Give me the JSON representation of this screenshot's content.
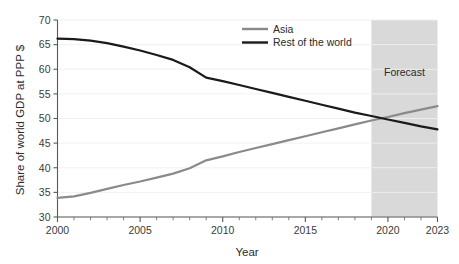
{
  "chart_data": {
    "type": "line",
    "title": "",
    "subtitle": "",
    "xlabel": "Year",
    "ylabel": "Share of world GDP at PPP $",
    "xlim": [
      2000,
      2023
    ],
    "ylim": [
      30,
      70
    ],
    "grid": true,
    "legend_position": "top-center",
    "background_color": "#ffffff",
    "x": [
      2000,
      2001,
      2002,
      2003,
      2004,
      2005,
      2006,
      2007,
      2008,
      2009,
      2010,
      2011,
      2012,
      2013,
      2014,
      2015,
      2016,
      2017,
      2018,
      2019,
      2020,
      2021,
      2022,
      2023
    ],
    "xticks": [
      2000,
      2001,
      2002,
      2003,
      2004,
      2005,
      2006,
      2007,
      2008,
      2009,
      2010,
      2011,
      2012,
      2013,
      2014,
      2015,
      2016,
      2017,
      2018,
      2019,
      2020,
      2021,
      2022,
      2023
    ],
    "xtick_labels": [
      "2000",
      "",
      "",
      "",
      "",
      "2005",
      "",
      "",
      "",
      "",
      "2010",
      "",
      "",
      "",
      "",
      "2015",
      "",
      "",
      "",
      "",
      "2020",
      "",
      "",
      "2023"
    ],
    "yticks": [
      30,
      35,
      40,
      45,
      50,
      55,
      60,
      65,
      70
    ],
    "ytick_labels": [
      "30",
      "35",
      "40",
      "45",
      "50",
      "55",
      "60",
      "65",
      "70"
    ],
    "series": [
      {
        "name": "Asia",
        "color": "#8a8a8a",
        "line_width": 2.2,
        "values": [
          33.9,
          34.2,
          34.9,
          35.7,
          36.5,
          37.2,
          38.0,
          38.8,
          39.9,
          41.5,
          42.3,
          43.2,
          44.0,
          44.8,
          45.6,
          46.4,
          47.2,
          48.0,
          48.8,
          49.6,
          50.3,
          51.1,
          51.8,
          52.5
        ]
      },
      {
        "name": "Rest of the world",
        "color": "#1a1a1a",
        "line_width": 2.2,
        "values": [
          66.2,
          66.1,
          65.8,
          65.3,
          64.6,
          63.8,
          62.9,
          61.9,
          60.4,
          58.3,
          57.6,
          56.8,
          56.0,
          55.2,
          54.4,
          53.6,
          52.8,
          52.0,
          51.2,
          50.5,
          49.8,
          49.1,
          48.4,
          47.8
        ]
      }
    ],
    "annotations": [
      {
        "name": "forecast-region",
        "label": "Forecast",
        "x_start": 2019,
        "x_end": 2023,
        "fill_color": "#d9d9d9"
      }
    ]
  },
  "legend": {
    "entries": [
      {
        "label": "Asia",
        "color": "#8a8a8a"
      },
      {
        "label": "Rest of the world",
        "color": "#1a1a1a"
      }
    ]
  },
  "axes": {
    "x_title": "Year",
    "y_title": "Share of world GDP at PPP $"
  },
  "forecast": {
    "label": "Forecast"
  }
}
